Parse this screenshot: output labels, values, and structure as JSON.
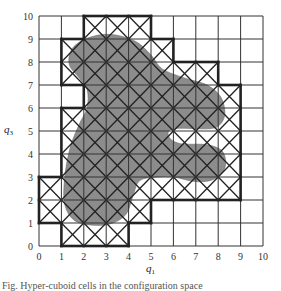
{
  "figure": {
    "x_axis": {
      "label": "q",
      "label_sub": "1",
      "ticks": [
        "0",
        "1",
        "2",
        "3",
        "4",
        "5",
        "6",
        "7",
        "8",
        "9",
        "10"
      ]
    },
    "y_axis": {
      "label": "q",
      "label_sub": "3",
      "ticks": [
        "0",
        "1",
        "2",
        "3",
        "4",
        "5",
        "6",
        "7",
        "8",
        "9",
        "10"
      ]
    },
    "grid": {
      "cols": 10,
      "rows": 10
    },
    "colors": {
      "shape_fill": "#8c8c8c",
      "grid_line": "#333333",
      "outline": "#222222"
    },
    "crossed_cells_by_row": [
      {
        "row": 0,
        "cols": [
          1,
          2,
          3
        ]
      },
      {
        "row": 1,
        "cols": [
          0,
          1,
          2,
          3,
          4
        ]
      },
      {
        "row": 2,
        "cols": [
          0,
          1,
          2,
          3,
          4,
          5,
          6,
          7,
          8
        ]
      },
      {
        "row": 3,
        "cols": [
          1,
          2,
          3,
          4,
          5,
          6,
          7,
          8
        ]
      },
      {
        "row": 4,
        "cols": [
          1,
          2,
          3,
          4,
          5,
          6,
          7,
          8
        ]
      },
      {
        "row": 5,
        "cols": [
          1,
          2,
          3,
          4,
          5,
          6,
          7,
          8
        ]
      },
      {
        "row": 6,
        "cols": [
          2,
          3,
          4,
          5,
          6,
          7,
          8
        ]
      },
      {
        "row": 7,
        "cols": [
          1,
          2,
          3,
          4,
          5,
          6,
          7
        ]
      },
      {
        "row": 8,
        "cols": [
          1,
          2,
          3,
          4,
          5
        ]
      },
      {
        "row": 9,
        "cols": [
          2,
          3,
          4
        ]
      }
    ],
    "shape_outline": [
      [
        3.2,
        9.2
      ],
      [
        4.3,
        8.9
      ],
      [
        5.0,
        8.3
      ],
      [
        5.5,
        7.7
      ],
      [
        6.5,
        7.3
      ],
      [
        7.5,
        7.0
      ],
      [
        8.1,
        6.5
      ],
      [
        8.3,
        5.8
      ],
      [
        8.1,
        5.3
      ],
      [
        7.6,
        5.1
      ],
      [
        6.0,
        5.1
      ],
      [
        5.8,
        4.75
      ],
      [
        6.3,
        4.45
      ],
      [
        7.5,
        4.4
      ],
      [
        8.2,
        4.1
      ],
      [
        8.3,
        3.4
      ],
      [
        7.8,
        2.9
      ],
      [
        7.0,
        2.8
      ],
      [
        6.0,
        3.0
      ],
      [
        5.3,
        3.0
      ],
      [
        4.5,
        2.85
      ],
      [
        4.2,
        2.2
      ],
      [
        3.9,
        1.4
      ],
      [
        3.3,
        1.0
      ],
      [
        2.5,
        0.9
      ],
      [
        1.6,
        1.1
      ],
      [
        1.15,
        1.8
      ],
      [
        1.15,
        3.0
      ],
      [
        1.4,
        4.3
      ],
      [
        1.8,
        5.3
      ],
      [
        2.15,
        6.0
      ],
      [
        2.15,
        6.8
      ],
      [
        1.8,
        7.3
      ],
      [
        1.35,
        7.9
      ],
      [
        1.5,
        8.6
      ],
      [
        2.2,
        9.05
      ]
    ]
  },
  "caption": {
    "text": "Fig. Hyper-cuboid cells in the configuration space"
  }
}
